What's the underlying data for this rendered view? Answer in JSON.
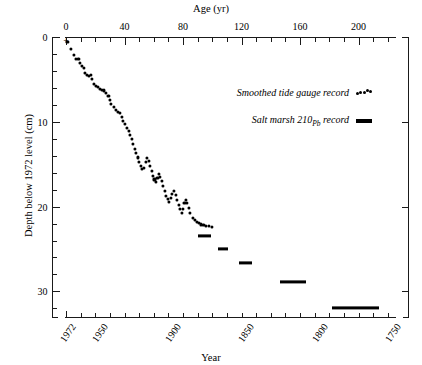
{
  "chart_data": {
    "type": "scatter",
    "title": "",
    "xlabel": "Year",
    "ylabel": "Depth below 1972 level (cm)",
    "secondary_xlabel": "Age (yr)",
    "grid": false,
    "legend_position": "upper-right-inside",
    "age_axis": {
      "label": "Age (yr)",
      "ticks": [
        0,
        40,
        80,
        120,
        160,
        200
      ],
      "tick_labels": [
        "0",
        "40",
        "80",
        "120",
        "160",
        "200"
      ],
      "minor_tick_interval": 10,
      "range": [
        -2,
        226
      ],
      "position": "top"
    },
    "year_axis": {
      "label": "Year",
      "ticks": [
        1972,
        1950,
        1900,
        1850,
        1800,
        1750
      ],
      "tick_labels": [
        "1972",
        "1950",
        "1900",
        "1850",
        "1800",
        "1750"
      ],
      "minor_tick_interval": 10,
      "direction": "decreasing",
      "position": "bottom",
      "reference_year": 1972
    },
    "y_axis": {
      "label": "Depth below 1972 level (cm)",
      "ticks": [
        0,
        10,
        20,
        30
      ],
      "tick_labels": [
        "0",
        "10",
        "20",
        "30"
      ],
      "minor_tick_interval": 2,
      "range": [
        0,
        34.5
      ],
      "inverted": true,
      "units": "cm"
    },
    "origin_marker": {
      "symbol": "+",
      "age": 0,
      "depth": 0
    },
    "series": [
      {
        "name": "Smoothed tide gauge record",
        "style": "dots",
        "marker": "filled-circle",
        "color": "#000000",
        "points": [
          [
            1.0,
            0.6
          ],
          [
            3.5,
            1.4
          ],
          [
            5.5,
            2.1
          ],
          [
            7.0,
            2.6
          ],
          [
            8.5,
            2.6
          ],
          [
            9.5,
            3.1
          ],
          [
            11.0,
            3.4
          ],
          [
            12.5,
            3.6
          ],
          [
            13.0,
            4.2
          ],
          [
            14.5,
            4.5
          ],
          [
            16.0,
            4.6
          ],
          [
            17.0,
            4.5
          ],
          [
            18.0,
            5.0
          ],
          [
            19.0,
            5.5
          ],
          [
            20.5,
            5.8
          ],
          [
            22.0,
            5.9
          ],
          [
            23.5,
            6.1
          ],
          [
            24.5,
            6.2
          ],
          [
            26.0,
            6.3
          ],
          [
            27.5,
            6.6
          ],
          [
            29.0,
            7.0
          ],
          [
            30.0,
            7.4
          ],
          [
            31.0,
            7.9
          ],
          [
            32.5,
            8.3
          ],
          [
            34.0,
            8.6
          ],
          [
            35.5,
            8.8
          ],
          [
            37.0,
            9.0
          ],
          [
            38.0,
            9.4
          ],
          [
            39.0,
            9.9
          ],
          [
            40.5,
            10.3
          ],
          [
            41.5,
            10.7
          ],
          [
            43.0,
            11.1
          ],
          [
            44.0,
            11.5
          ],
          [
            45.0,
            12.0
          ],
          [
            46.0,
            12.6
          ],
          [
            47.0,
            13.2
          ],
          [
            48.0,
            13.7
          ],
          [
            49.0,
            14.2
          ],
          [
            50.0,
            14.7
          ],
          [
            51.0,
            15.2
          ],
          [
            52.0,
            15.6
          ],
          [
            53.0,
            15.4
          ],
          [
            54.5,
            14.7
          ],
          [
            55.5,
            14.3
          ],
          [
            56.5,
            14.6
          ],
          [
            57.5,
            15.2
          ],
          [
            58.5,
            15.8
          ],
          [
            59.5,
            16.4
          ],
          [
            60.5,
            16.8
          ],
          [
            61.5,
            17.1
          ],
          [
            62.5,
            16.6
          ],
          [
            63.5,
            16.2
          ],
          [
            64.5,
            16.5
          ],
          [
            65.5,
            17.0
          ],
          [
            66.5,
            17.6
          ],
          [
            67.5,
            18.2
          ],
          [
            68.5,
            18.7
          ],
          [
            69.5,
            19.1
          ],
          [
            70.5,
            19.4
          ],
          [
            71.5,
            19.0
          ],
          [
            72.5,
            18.5
          ],
          [
            74.0,
            18.2
          ],
          [
            75.0,
            18.6
          ],
          [
            76.0,
            19.2
          ],
          [
            77.0,
            19.8
          ],
          [
            78.0,
            20.3
          ],
          [
            79.0,
            20.7
          ],
          [
            80.0,
            20.3
          ],
          [
            81.0,
            19.6
          ],
          [
            82.0,
            19.2
          ],
          [
            83.0,
            19.6
          ],
          [
            84.0,
            20.2
          ],
          [
            85.0,
            20.8
          ],
          [
            86.5,
            21.3
          ],
          [
            88.0,
            21.6
          ],
          [
            89.5,
            21.8
          ],
          [
            91.0,
            21.9
          ],
          [
            92.5,
            22.1
          ],
          [
            94.0,
            22.2
          ],
          [
            96.0,
            22.3
          ],
          [
            98.0,
            22.3
          ],
          [
            100.0,
            22.4
          ]
        ]
      },
      {
        "name": "Salt marsh 210Pb record",
        "style": "horizontal-bars",
        "color": "#000000",
        "bars": [
          {
            "age_start": 90,
            "age_end": 99,
            "depth": 23.5
          },
          {
            "age_start": 104,
            "age_end": 111,
            "depth": 25.0
          },
          {
            "age_start": 118,
            "age_end": 127,
            "depth": 26.6
          },
          {
            "age_start": 146,
            "age_end": 164,
            "depth": 28.9
          },
          {
            "age_start": 182,
            "age_end": 214,
            "depth": 31.9
          }
        ]
      }
    ]
  },
  "legend": {
    "entries": [
      {
        "label": "Smoothed tide gauge record",
        "swatch": "dots"
      },
      {
        "label_prefix": "Salt marsh 210",
        "label_sub": "Pb",
        "label_suffix": " record",
        "swatch": "bar"
      }
    ]
  }
}
